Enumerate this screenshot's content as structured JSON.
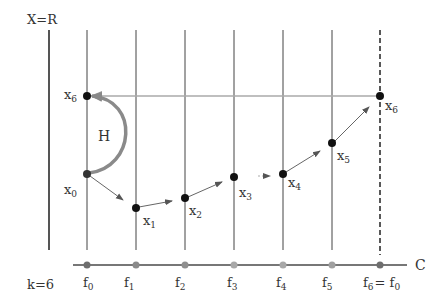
{
  "labels": {
    "x_axis_top": "X=R",
    "k_label": "k=6",
    "c_axis": "C",
    "h_label": "H"
  },
  "fibers": [
    {
      "label": "f",
      "sub": "0",
      "x": 87
    },
    {
      "label": "f",
      "sub": "1",
      "x": 136
    },
    {
      "label": "f",
      "sub": "2",
      "x": 185
    },
    {
      "label": "f",
      "sub": "3",
      "x": 234
    },
    {
      "label": "f",
      "sub": "4",
      "x": 283
    },
    {
      "label": "f",
      "sub": "5",
      "x": 332
    },
    {
      "label": "f",
      "sub": "6",
      "suffix": "= f",
      "suffix_sub": "0",
      "x": 380
    }
  ],
  "points": [
    {
      "label": "x",
      "sub": "0",
      "x": 87,
      "y": 174
    },
    {
      "label": "x",
      "sub": "1",
      "x": 136,
      "y": 208
    },
    {
      "label": "x",
      "sub": "2",
      "x": 185,
      "y": 198
    },
    {
      "label": "x",
      "sub": "3",
      "x": 234,
      "y": 177
    },
    {
      "label": "x",
      "sub": "4",
      "x": 283,
      "y": 174
    },
    {
      "label": "x",
      "sub": "5",
      "x": 332,
      "y": 143
    },
    {
      "label": "x",
      "sub": "6",
      "x": 380,
      "y": 96
    },
    {
      "label": "x",
      "sub": "6",
      "x": 87,
      "y": 96
    }
  ],
  "colors": {
    "line": "#444444",
    "arrow": "#666666",
    "arc": "#8a8a8a",
    "return_arrow": "#a0a0a0",
    "point": "#111111",
    "c_dot_dark": "#6e6e6e",
    "c_dot_light": "#a8a8a8"
  }
}
